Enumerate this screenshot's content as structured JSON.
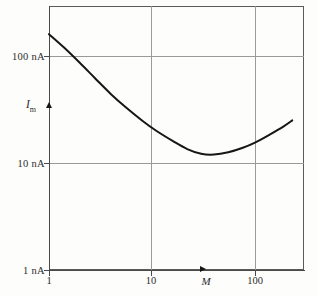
{
  "figure": {
    "background_color": "#fdfdfc",
    "frame_color": "#5a5a5a",
    "grid_color": "#9a9a9a",
    "curve_color": "#161616"
  },
  "axes": {
    "y_variable_label": "I",
    "y_variable_subscript": "m",
    "x_variable_label": "M"
  },
  "ticks": {
    "y": [
      {
        "label": "100 nA",
        "value": 100
      },
      {
        "label": "10 nA",
        "value": 10
      },
      {
        "label": "1 nA",
        "value": 1
      }
    ],
    "x": [
      {
        "label": "1",
        "value": 1
      },
      {
        "label": "10",
        "value": 10
      },
      {
        "label": "100",
        "value": 100
      }
    ]
  },
  "chart_data": {
    "type": "line",
    "title": "",
    "xlabel": "M",
    "ylabel": "I_m",
    "xscale": "log",
    "yscale": "log",
    "xlim": [
      1,
      330
    ],
    "ylim": [
      1,
      1000
    ],
    "grid": true,
    "legend": null,
    "x_unit": "",
    "y_unit": "nA",
    "series": [
      {
        "name": "Total noise current",
        "x": [
          1,
          1.4,
          2,
          2.8,
          4,
          5.6,
          8,
          11,
          16,
          22,
          30,
          40,
          55,
          75,
          100,
          140,
          190,
          230
        ],
        "values": [
          160,
          120,
          86,
          62,
          44,
          33,
          25,
          20,
          16,
          13.5,
          12.2,
          12.0,
          12.6,
          13.8,
          15.5,
          18.5,
          22.0,
          25.0
        ]
      }
    ],
    "annotations": [
      {
        "name": "y-axis-variable-marker",
        "axis": "y",
        "value": 38,
        "label": "I_m"
      },
      {
        "name": "x-axis-variable-marker",
        "axis": "x",
        "value": 35,
        "label": "M"
      }
    ]
  }
}
